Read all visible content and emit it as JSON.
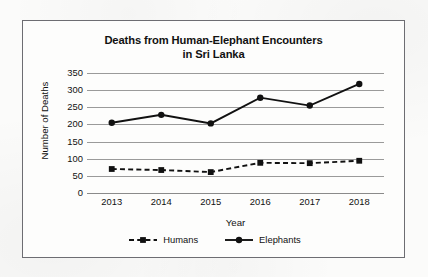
{
  "chart_data": {
    "type": "line",
    "title": "Deaths from Human-Elephant Encounters in Sri Lanka",
    "title_line1": "Deaths from Human-Elephant Encounters",
    "title_line2": "in Sri Lanka",
    "xlabel": "Year",
    "ylabel": "Number of Deaths",
    "categories": [
      "2013",
      "2014",
      "2015",
      "2016",
      "2017",
      "2018"
    ],
    "x": [
      2013,
      2014,
      2015,
      2016,
      2017,
      2018
    ],
    "ylim": [
      0,
      350
    ],
    "ytick_step": 50,
    "yticks": [
      "350",
      "300",
      "250",
      "200",
      "150",
      "100",
      "50",
      "0"
    ],
    "ytick_values": [
      350,
      300,
      250,
      200,
      150,
      100,
      50,
      0
    ],
    "grid": true,
    "grid_axis": "y",
    "legend_position": "bottom",
    "series": [
      {
        "name": "Humans",
        "values": [
          70,
          67,
          61,
          88,
          87,
          94
        ],
        "line_style": "dashed",
        "marker": "square",
        "color": "#111111"
      },
      {
        "name": "Elephants",
        "values": [
          205,
          228,
          203,
          278,
          255,
          318
        ],
        "line_style": "solid",
        "marker": "circle",
        "color": "#111111"
      }
    ]
  },
  "figure": {
    "border_color": "#6d6d72",
    "background": "#fdfdfc",
    "gridline_color": "#9a9a9a"
  }
}
